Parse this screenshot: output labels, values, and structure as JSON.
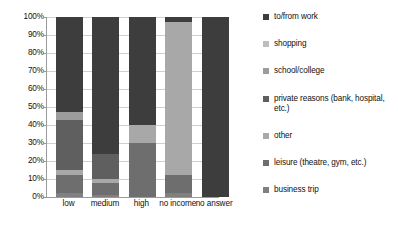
{
  "chart_data": {
    "type": "bar",
    "stacked": true,
    "stack_mode": "percent",
    "title": "",
    "xlabel": "",
    "ylabel": "",
    "ylim": [
      0,
      100
    ],
    "grid": true,
    "legend_position": "right",
    "categories": [
      "low",
      "medium",
      "high",
      "no income",
      "no answer"
    ],
    "y_tick_labels": [
      "0%",
      "10%",
      "20%",
      "30%",
      "40%",
      "50%",
      "60%",
      "70%",
      "80%",
      "90%",
      "100%"
    ],
    "y_ticks": [
      0,
      10,
      20,
      30,
      40,
      50,
      60,
      70,
      80,
      90,
      100
    ],
    "series": [
      {
        "name": "business trip",
        "color": "#808080",
        "values": [
          2,
          1,
          0,
          2,
          0
        ]
      },
      {
        "name": "leisure (theatre, gym, etc.)",
        "color": "#6e6e6e",
        "values": [
          10,
          7,
          30,
          10,
          0
        ]
      },
      {
        "name": "other",
        "color": "#a8a8a8",
        "values": [
          3,
          2,
          10,
          85,
          0
        ]
      },
      {
        "name": "private reasons (bank, hospital, etc.)",
        "color": "#5f5f5f",
        "values": [
          28,
          14,
          0,
          0,
          0
        ]
      },
      {
        "name": "school/college",
        "color": "#9c9c9c",
        "values": [
          4,
          0,
          0,
          0,
          0
        ]
      },
      {
        "name": "shopping",
        "color": "#bdbdbd",
        "values": [
          0,
          0,
          0,
          0,
          0
        ]
      },
      {
        "name": "to/from work",
        "color": "#3d3d3d",
        "values": [
          53,
          76,
          60,
          3,
          100
        ]
      }
    ],
    "legend_entries": [
      {
        "label": "to/from work",
        "color": "#3d3d3d"
      },
      {
        "label": "shopping",
        "color": "#bdbdbd"
      },
      {
        "label": "school/college",
        "color": "#9c9c9c"
      },
      {
        "label": "private reasons (bank, hospital, etc.)",
        "color": "#5f5f5f"
      },
      {
        "label": "other",
        "color": "#a8a8a8"
      },
      {
        "label": "leisure (theatre, gym, etc.)",
        "color": "#6e6e6e"
      },
      {
        "label": "business trip",
        "color": "#808080"
      }
    ]
  }
}
